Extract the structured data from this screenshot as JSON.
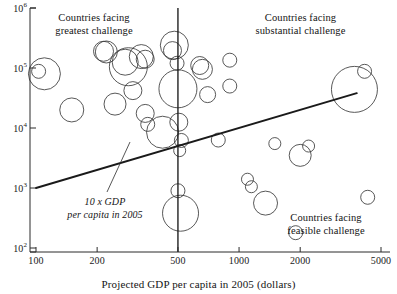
{
  "chart_data": {
    "type": "scatter",
    "title": "",
    "xlabel": "Projected GDP per capita in 2005 (dollars)",
    "ylabel": "",
    "xscale": "log",
    "yscale": "log",
    "xlim": [
      90,
      5500
    ],
    "ylim": [
      100,
      1000000
    ],
    "grid": false,
    "legend_position": "none",
    "xticks": [
      100,
      200,
      500,
      1000,
      2000,
      5000
    ],
    "xticklabels": [
      "100",
      "200",
      "500",
      "1000",
      "2000",
      "5000"
    ],
    "yticks": [
      100,
      1000,
      10000,
      100000,
      1000000
    ],
    "yticklabels": [
      "10",
      "10",
      "10",
      "10",
      "10"
    ],
    "ytickexponents": [
      "2",
      "3",
      "4",
      "5",
      "6"
    ],
    "annotations": [
      {
        "name": "trend-annotation",
        "text": "10 x GDP\nper capita in 2005",
        "style": "italic"
      },
      {
        "name": "zone-greatest",
        "text": "Countries facing\ngreatest challenge"
      },
      {
        "name": "zone-substantial",
        "text": "Countries facing\nsubstantial challenge"
      },
      {
        "name": "zone-feasible",
        "text": "Countries facing\nfeasible challenge"
      }
    ],
    "trend_line": {
      "name": "10 x GDP per capita in 2005",
      "x": [
        100,
        3800
      ],
      "y": [
        1000,
        38000
      ],
      "color": "#1a1a1a"
    },
    "threshold_line": {
      "name": "GDP per capita = 500 dollars",
      "x": 500,
      "color": "#1a1a1a"
    },
    "bubbles": [
      {
        "x": 103,
        "y": 88000,
        "r": 7
      },
      {
        "x": 110,
        "y": 80000,
        "r": 16
      },
      {
        "x": 150,
        "y": 20000,
        "r": 12
      },
      {
        "x": 215,
        "y": 190000,
        "r": 10
      },
      {
        "x": 222,
        "y": 185000,
        "r": 11
      },
      {
        "x": 275,
        "y": 125000,
        "r": 13
      },
      {
        "x": 285,
        "y": 105000,
        "r": 19
      },
      {
        "x": 330,
        "y": 155000,
        "r": 12
      },
      {
        "x": 345,
        "y": 140000,
        "r": 9
      },
      {
        "x": 300,
        "y": 42000,
        "r": 9
      },
      {
        "x": 245,
        "y": 25000,
        "r": 11
      },
      {
        "x": 345,
        "y": 17500,
        "r": 9
      },
      {
        "x": 355,
        "y": 11500,
        "r": 7
      },
      {
        "x": 420,
        "y": 8500,
        "r": 16
      },
      {
        "x": 480,
        "y": 240000,
        "r": 14
      },
      {
        "x": 470,
        "y": 195000,
        "r": 9
      },
      {
        "x": 495,
        "y": 120000,
        "r": 7
      },
      {
        "x": 500,
        "y": 45000,
        "r": 19
      },
      {
        "x": 505,
        "y": 12500,
        "r": 9
      },
      {
        "x": 520,
        "y": 6200,
        "r": 7
      },
      {
        "x": 510,
        "y": 4200,
        "r": 6
      },
      {
        "x": 500,
        "y": 900,
        "r": 7
      },
      {
        "x": 515,
        "y": 380,
        "r": 18
      },
      {
        "x": 640,
        "y": 110000,
        "r": 9
      },
      {
        "x": 660,
        "y": 95000,
        "r": 10
      },
      {
        "x": 700,
        "y": 36000,
        "r": 8
      },
      {
        "x": 790,
        "y": 6300,
        "r": 7
      },
      {
        "x": 900,
        "y": 135000,
        "r": 7
      },
      {
        "x": 900,
        "y": 50000,
        "r": 7
      },
      {
        "x": 1100,
        "y": 1400,
        "r": 6
      },
      {
        "x": 1150,
        "y": 1050,
        "r": 6
      },
      {
        "x": 1350,
        "y": 560,
        "r": 12
      },
      {
        "x": 1500,
        "y": 5500,
        "r": 6
      },
      {
        "x": 1900,
        "y": 180,
        "r": 7
      },
      {
        "x": 2000,
        "y": 3500,
        "r": 11
      },
      {
        "x": 2200,
        "y": 5000,
        "r": 6
      },
      {
        "x": 3700,
        "y": 44000,
        "r": 23
      },
      {
        "x": 4150,
        "y": 88000,
        "r": 7
      },
      {
        "x": 4300,
        "y": 700,
        "r": 7
      }
    ]
  }
}
